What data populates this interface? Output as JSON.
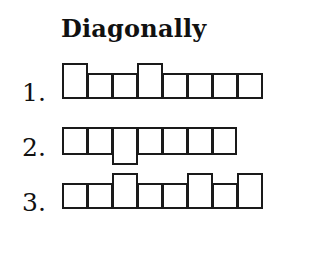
{
  "title": "Diagonally",
  "rows": [
    {
      "label": "1.",
      "label_top": 80,
      "cells": [
        {
          "x": 62,
          "y": 63,
          "w": 26,
          "h": 36
        },
        {
          "x": 87,
          "y": 73,
          "w": 26,
          "h": 26
        },
        {
          "x": 112,
          "y": 73,
          "w": 26,
          "h": 26
        },
        {
          "x": 137,
          "y": 63,
          "w": 26,
          "h": 36
        },
        {
          "x": 162,
          "y": 73,
          "w": 26,
          "h": 26
        },
        {
          "x": 187,
          "y": 73,
          "w": 26,
          "h": 26
        },
        {
          "x": 212,
          "y": 73,
          "w": 26,
          "h": 26
        },
        {
          "x": 237,
          "y": 73,
          "w": 26,
          "h": 26
        }
      ]
    },
    {
      "label": "2.",
      "label_top": 135,
      "cells": [
        {
          "x": 62,
          "y": 127,
          "w": 26,
          "h": 28
        },
        {
          "x": 87,
          "y": 127,
          "w": 26,
          "h": 28
        },
        {
          "x": 112,
          "y": 127,
          "w": 26,
          "h": 38
        },
        {
          "x": 137,
          "y": 127,
          "w": 26,
          "h": 28
        },
        {
          "x": 162,
          "y": 127,
          "w": 26,
          "h": 28
        },
        {
          "x": 187,
          "y": 127,
          "w": 26,
          "h": 28
        },
        {
          "x": 212,
          "y": 127,
          "w": 25,
          "h": 28
        }
      ]
    },
    {
      "label": "3.",
      "label_top": 190,
      "cells": [
        {
          "x": 62,
          "y": 183,
          "w": 26,
          "h": 26
        },
        {
          "x": 87,
          "y": 183,
          "w": 26,
          "h": 26
        },
        {
          "x": 112,
          "y": 173,
          "w": 26,
          "h": 36
        },
        {
          "x": 137,
          "y": 183,
          "w": 26,
          "h": 26
        },
        {
          "x": 162,
          "y": 183,
          "w": 26,
          "h": 26
        },
        {
          "x": 187,
          "y": 173,
          "w": 26,
          "h": 36
        },
        {
          "x": 212,
          "y": 183,
          "w": 26,
          "h": 26
        },
        {
          "x": 237,
          "y": 173,
          "w": 26,
          "h": 36
        }
      ]
    }
  ]
}
